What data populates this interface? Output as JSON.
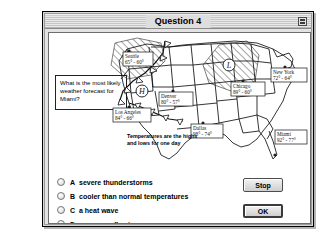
{
  "window": {
    "title": "Question 4",
    "collapse_icon": "collapse-box-icon"
  },
  "question": {
    "text": "What is the most likely weather forecast for Miami?"
  },
  "map": {
    "caption": "Temperatures are the highs and lows for one day",
    "pressure_high_label": "H",
    "pressure_low_label": "L",
    "cities": [
      {
        "name": "Seattle",
        "temps": "65° - 60°"
      },
      {
        "name": "Los Angeles",
        "temps": "84° - 66°"
      },
      {
        "name": "Denver",
        "temps": "80° - 57°"
      },
      {
        "name": "Dallas",
        "temps": "98° - 74°"
      },
      {
        "name": "Chicago",
        "temps": "89° - 60°"
      },
      {
        "name": "New York",
        "temps": "72° - 64°"
      },
      {
        "name": "Miami",
        "temps": "92° - 77°"
      }
    ]
  },
  "options": [
    {
      "letter": "A",
      "label": "severe thunderstorms"
    },
    {
      "letter": "B",
      "label": "cooler than normal temperatures"
    },
    {
      "letter": "C",
      "label": "a heat wave"
    },
    {
      "letter": "D",
      "label": "rare snow flurries"
    }
  ],
  "buttons": {
    "stop": "Stop",
    "ok": "OK"
  },
  "colors": {
    "window_bg": "#d8d8d8",
    "content_bg": "#ffffff",
    "ink": "#000000"
  }
}
